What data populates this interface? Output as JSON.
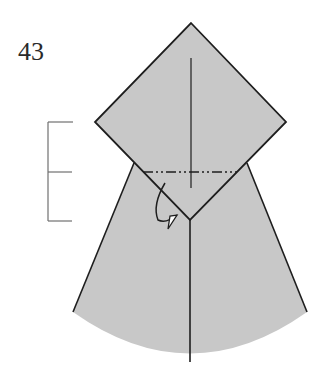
{
  "step": {
    "number": "43"
  },
  "colors": {
    "paper": "#c8c8c8",
    "line": "#1e1e1e",
    "bracket": "#707070",
    "background": "#ffffff"
  },
  "diagram": {
    "type": "origami-fold-step",
    "elements": [
      "diamond-flap",
      "cone-body",
      "valley-crease-center",
      "mountain-fold-line",
      "fold-under-arrow",
      "thirds-bracket"
    ]
  }
}
